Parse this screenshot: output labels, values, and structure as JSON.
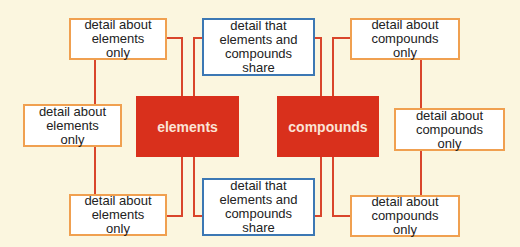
{
  "colors": {
    "background": "#fbf6df",
    "connector": "#d9452b",
    "main_box": "#d9301c",
    "only_border": "#f0a050",
    "shared_border": "#3c78b4"
  },
  "main": {
    "elements": "elements",
    "compounds": "compounds"
  },
  "elements_only": [
    "detail about elements only",
    "detail about elements only",
    "detail about elements only"
  ],
  "compounds_only": [
    "detail about compounds only",
    "detail about compounds only",
    "detail about compounds only"
  ],
  "shared": [
    "detail that elements and compounds share",
    "detail that elements and compounds share"
  ]
}
